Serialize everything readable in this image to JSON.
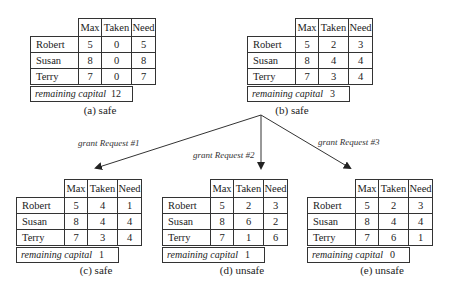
{
  "columns": [
    "Max",
    "Taken",
    "Need"
  ],
  "capital_label": "remaining capital",
  "states": [
    {
      "id": "a",
      "caption": "(a) safe",
      "rows": [
        {
          "name": "Robert",
          "max": "5",
          "taken": "0",
          "need": "5"
        },
        {
          "name": "Susan",
          "max": "8",
          "taken": "0",
          "need": "8"
        },
        {
          "name": "Terry",
          "max": "7",
          "taken": "0",
          "need": "7"
        }
      ],
      "capital": "12"
    },
    {
      "id": "b",
      "caption": "(b) safe",
      "rows": [
        {
          "name": "Robert",
          "max": "5",
          "taken": "2",
          "need": "3"
        },
        {
          "name": "Susan",
          "max": "8",
          "taken": "4",
          "need": "4"
        },
        {
          "name": "Terry",
          "max": "7",
          "taken": "3",
          "need": "4"
        }
      ],
      "capital": "3"
    },
    {
      "id": "c",
      "caption": "(c) safe",
      "rows": [
        {
          "name": "Robert",
          "max": "5",
          "taken": "4",
          "need": "1"
        },
        {
          "name": "Susan",
          "max": "8",
          "taken": "4",
          "need": "4"
        },
        {
          "name": "Terry",
          "max": "7",
          "taken": "3",
          "need": "4"
        }
      ],
      "capital": "1"
    },
    {
      "id": "d",
      "caption": "(d) unsafe",
      "rows": [
        {
          "name": "Robert",
          "max": "5",
          "taken": "2",
          "need": "3"
        },
        {
          "name": "Susan",
          "max": "8",
          "taken": "6",
          "need": "2"
        },
        {
          "name": "Terry",
          "max": "7",
          "taken": "1",
          "need": "6"
        }
      ],
      "capital": "1"
    },
    {
      "id": "e",
      "caption": "(e) unsafe",
      "rows": [
        {
          "name": "Robert",
          "max": "5",
          "taken": "2",
          "need": "3"
        },
        {
          "name": "Susan",
          "max": "8",
          "taken": "4",
          "need": "4"
        },
        {
          "name": "Terry",
          "max": "7",
          "taken": "6",
          "need": "1"
        }
      ],
      "capital": "0"
    }
  ],
  "transitions": [
    {
      "label": "grant Request #1",
      "from": "b",
      "to": "c"
    },
    {
      "label": "grant Request #2",
      "from": "b",
      "to": "d"
    },
    {
      "label": "grant Request #3",
      "from": "b",
      "to": "e"
    }
  ],
  "highlight_colors": {
    "c": "#5555cc",
    "d": "#aa44aa",
    "e": "#66bb44"
  }
}
